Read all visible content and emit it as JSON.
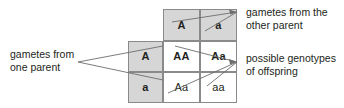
{
  "diagram": {
    "colors": {
      "shaded_cell": "#d6d6d6",
      "plain_cell": "#ffffff",
      "border": "#8a8a8a",
      "text": "#231f20",
      "leader_line": "#6d6d6d"
    },
    "punnett_square": {
      "column_headers": [
        "A",
        "a"
      ],
      "row_headers": [
        "A",
        "a"
      ],
      "offspring": [
        [
          "AA",
          "Aa"
        ],
        [
          "Aa",
          "aa"
        ]
      ],
      "cells": {
        "col_header_A": "A",
        "col_header_a": "a",
        "row_header_A": "A",
        "row_header_a": "a",
        "AA": "AA",
        "Aa_top": "Aa",
        "Aa_bottom": "Aa",
        "aa": "aa"
      }
    },
    "annotations": {
      "left": "gametes from\none parent",
      "top_right": "gametes from the\nother parent",
      "bottom_right": "possible genotypes\nof offspring"
    }
  }
}
